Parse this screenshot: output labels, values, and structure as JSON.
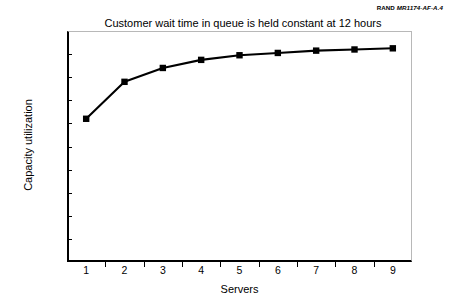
{
  "credit": {
    "org": "RAND",
    "document_id": "MR1174-AF-A.4"
  },
  "chart_data": {
    "type": "line",
    "title": "Customer wait time in queue is held constant at 12 hours",
    "xlabel": "Servers",
    "ylabel": "Capacity utilization",
    "categories": [
      1,
      2,
      3,
      4,
      5,
      6,
      7,
      8,
      9
    ],
    "x_tick_labels": [
      "1",
      "2",
      "3",
      "4",
      "5",
      "6",
      "7",
      "8",
      "9"
    ],
    "values": [
      62,
      78,
      84,
      87.5,
      89.5,
      90.5,
      91.5,
      92,
      92.5
    ],
    "y_tick_labels": [
      "100%",
      "90%",
      "80%",
      "70%",
      "60%",
      "50%",
      "40%",
      "30%",
      "20%",
      "10%",
      "0%"
    ],
    "y_tick_values": [
      100,
      90,
      80,
      70,
      60,
      50,
      40,
      30,
      20,
      10,
      0
    ],
    "ylim": [
      0,
      100
    ],
    "xlim": [
      0.5,
      9.5
    ],
    "grid": false,
    "legend": false,
    "series_color": "#000000",
    "marker": "square"
  }
}
